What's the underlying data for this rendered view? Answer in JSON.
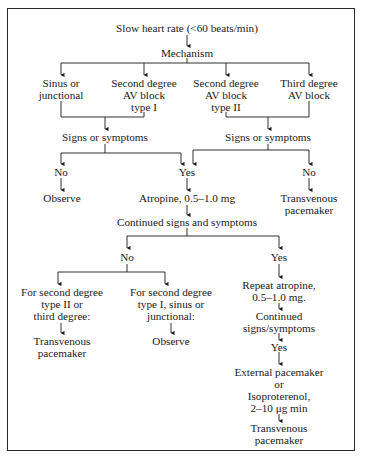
{
  "diagram": {
    "type": "flowchart",
    "topic": "Bradycardia management algorithm",
    "nodes": {
      "start": {
        "lines": [
          "Slow heart rate (<60 beats/min)"
        ]
      },
      "mechanism": {
        "lines": [
          "Mechanism"
        ]
      },
      "sinus": {
        "lines": [
          "Sinus or",
          "junctional"
        ]
      },
      "avb1": {
        "lines": [
          "Second degree",
          "AV block",
          "type I"
        ]
      },
      "avb2": {
        "lines": [
          "Second degree",
          "AV block",
          "type II"
        ]
      },
      "avb3": {
        "lines": [
          "Third degree",
          "AV block"
        ]
      },
      "signs_left": {
        "lines": [
          "Signs or symptoms"
        ]
      },
      "signs_right": {
        "lines": [
          "Signs or symptoms"
        ]
      },
      "no_left": {
        "lines": [
          "No"
        ]
      },
      "yes_mid": {
        "lines": [
          "Yes"
        ]
      },
      "no_right": {
        "lines": [
          "No"
        ]
      },
      "observe_1": {
        "lines": [
          "Observe"
        ]
      },
      "atropine": {
        "lines": [
          "Atropine, 0.5–1.0 mg"
        ]
      },
      "tv_pacer_1": {
        "lines": [
          "Transvenous",
          "pacemaker"
        ]
      },
      "continued": {
        "lines": [
          "Continued signs and symptoms"
        ]
      },
      "no_2": {
        "lines": [
          "No"
        ]
      },
      "yes_2": {
        "lines": [
          "Yes"
        ]
      },
      "for_type2": {
        "lines": [
          "For second degree",
          "type II or",
          "third degree:"
        ]
      },
      "for_type1": {
        "lines": [
          "For second degree",
          "type I, sinus or",
          "junctional:"
        ]
      },
      "repeat_atropine": {
        "lines": [
          "Repeat atropine,",
          "0.5–1.0 mg."
        ]
      },
      "tv_pacer_2": {
        "lines": [
          "Transvenous",
          "pacemaker"
        ]
      },
      "observe_2": {
        "lines": [
          "Observe"
        ]
      },
      "continued_2": {
        "lines": [
          "Continued",
          "signs/symptoms"
        ]
      },
      "yes_3": {
        "lines": [
          "Yes"
        ]
      },
      "external": {
        "lines": [
          "External pacemaker",
          "or",
          "Isoproterenol,",
          "2–10 μg min"
        ]
      },
      "tv_pacer_3": {
        "lines": [
          "Transvenous",
          "pacemaker"
        ]
      }
    },
    "edges": [
      [
        "start",
        "mechanism"
      ],
      [
        "mechanism",
        "sinus"
      ],
      [
        "mechanism",
        "avb1"
      ],
      [
        "mechanism",
        "avb2"
      ],
      [
        "mechanism",
        "avb3"
      ],
      [
        "sinus",
        "signs_left"
      ],
      [
        "avb1",
        "signs_left"
      ],
      [
        "avb2",
        "signs_right"
      ],
      [
        "avb3",
        "signs_right"
      ],
      [
        "signs_left",
        "no_left"
      ],
      [
        "signs_left",
        "yes_mid"
      ],
      [
        "signs_right",
        "yes_mid"
      ],
      [
        "signs_right",
        "no_right"
      ],
      [
        "no_left",
        "observe_1"
      ],
      [
        "yes_mid",
        "atropine"
      ],
      [
        "no_right",
        "tv_pacer_1"
      ],
      [
        "atropine",
        "continued"
      ],
      [
        "continued",
        "no_2"
      ],
      [
        "continued",
        "yes_2"
      ],
      [
        "no_2",
        "for_type2"
      ],
      [
        "no_2",
        "for_type1"
      ],
      [
        "for_type2",
        "tv_pacer_2"
      ],
      [
        "for_type1",
        "observe_2"
      ],
      [
        "yes_2",
        "repeat_atropine"
      ],
      [
        "repeat_atropine",
        "continued_2"
      ],
      [
        "continued_2",
        "yes_3"
      ],
      [
        "yes_3",
        "external"
      ],
      [
        "external",
        "tv_pacer_3"
      ]
    ],
    "colors": {
      "ink": "#1a1a1a",
      "border": "#2a2a2a",
      "background": "#ffffff"
    }
  }
}
